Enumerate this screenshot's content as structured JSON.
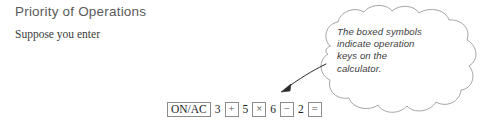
{
  "section": {
    "title": "Priority of Operations",
    "intro": "Suppose you enter"
  },
  "key_sequence": {
    "items": [
      {
        "label": "ON/AC",
        "kind": "key"
      },
      {
        "label": "3",
        "kind": "digit"
      },
      {
        "label": "+",
        "kind": "op"
      },
      {
        "label": "5",
        "kind": "digit"
      },
      {
        "label": "×",
        "kind": "op"
      },
      {
        "label": "6",
        "kind": "digit"
      },
      {
        "label": "−",
        "kind": "op"
      },
      {
        "label": "2",
        "kind": "digit"
      },
      {
        "label": "=",
        "kind": "op"
      }
    ]
  },
  "callout": {
    "text": "The boxed symbols indicate operation keys on the calculator.",
    "line1": "The boxed symbols",
    "line2": "indicate operation",
    "line3": "keys on the",
    "line4": "calculator."
  },
  "colors": {
    "title": "#5a5a5a",
    "body": "#3a3a3a",
    "outline": "#9a9a9a",
    "key_border": "#8c8c8c",
    "background": "#ffffff"
  }
}
